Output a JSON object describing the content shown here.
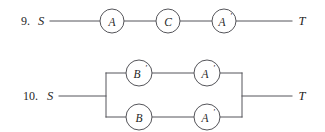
{
  "page": {
    "background_color": "#ffffff",
    "ink_color": "#55555a",
    "text_color": "#1f1f1f",
    "width": 325,
    "height": 132
  },
  "problems": [
    {
      "id": "problem-9",
      "number": "9.",
      "number_x": 30,
      "number_y": 21,
      "type": "series-network",
      "source_terminal": {
        "label": "S",
        "x": 41,
        "y": 21
      },
      "sink_terminal": {
        "label": "T",
        "x": 302,
        "y": 21
      },
      "nodes": [
        {
          "label": "A",
          "prime": "",
          "cx": 112,
          "cy": 21,
          "r": 12
        },
        {
          "label": "C",
          "prime": "",
          "cx": 168,
          "cy": 21,
          "r": 12
        },
        {
          "label": "A",
          "prime": "′",
          "cx": 224,
          "cy": 21,
          "r": 12
        }
      ]
    },
    {
      "id": "problem-10",
      "number": "10.",
      "number_x": 38,
      "number_y": 96,
      "type": "parallel-network",
      "source_terminal": {
        "label": "S",
        "x": 50,
        "y": 96
      },
      "sink_terminal": {
        "label": "T",
        "x": 302,
        "y": 96
      },
      "left_rail_x": 106,
      "right_rail_x": 242,
      "top_branch_y": 73,
      "bottom_branch_y": 117,
      "branches": [
        {
          "name": "top-branch",
          "nodes": [
            {
              "label": "B",
              "prime": "′",
              "cx": 139,
              "cy": 73,
              "r": 13
            },
            {
              "label": "A",
              "prime": "′",
              "cx": 207,
              "cy": 73,
              "r": 13
            }
          ]
        },
        {
          "name": "bottom-branch",
          "nodes": [
            {
              "label": "B",
              "prime": "",
              "cx": 139,
              "cy": 117,
              "r": 13
            },
            {
              "label": "A",
              "prime": "′",
              "cx": 207,
              "cy": 117,
              "r": 13
            }
          ]
        }
      ]
    }
  ]
}
